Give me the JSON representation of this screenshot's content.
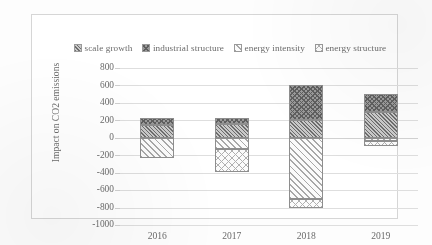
{
  "chart_data": {
    "type": "bar",
    "stacked": true,
    "title": "",
    "xlabel": "",
    "ylabel": "Impact on CO2 emissions",
    "categories": [
      "2016",
      "2017",
      "2018",
      "2019"
    ],
    "ylim": [
      -1000,
      800
    ],
    "ytick_step": 200,
    "yticks": [
      "800",
      "600",
      "400",
      "200",
      "0",
      "-200",
      "-400",
      "-600",
      "-800",
      "-1000"
    ],
    "grid": true,
    "legend_position": "top",
    "series": [
      {
        "name": "scale growth",
        "pattern": "dark-diagonal-hatch",
        "values": [
          150,
          160,
          200,
          300
        ]
      },
      {
        "name": "industrial structure",
        "pattern": "dark-crosshatch",
        "values": [
          80,
          70,
          400,
          200
        ]
      },
      {
        "name": "energy intensity",
        "pattern": "light-diagonal-stripe",
        "values": [
          -230,
          -130,
          -700,
          -40
        ]
      },
      {
        "name": "energy structure",
        "pattern": "light-open-crosshatch",
        "values": [
          0,
          -260,
          -100,
          -60
        ]
      }
    ]
  },
  "legend": {
    "items": [
      {
        "label": "scale growth",
        "pattern": "dark-diagonal-hatch"
      },
      {
        "label": "industrial structure",
        "pattern": "dark-crosshatch"
      },
      {
        "label": "energy intensity",
        "pattern": "light-diagonal-stripe"
      },
      {
        "label": "energy structure",
        "pattern": "light-open-crosshatch"
      }
    ]
  },
  "axis": {
    "y_title": "Impact on CO2 emissions",
    "y_labels": [
      "800",
      "600",
      "400",
      "200",
      "0",
      "-200",
      "-400",
      "-600",
      "-800",
      "-1000"
    ],
    "x_labels": [
      "2016",
      "2017",
      "2018",
      "2019"
    ]
  },
  "colors": {
    "frame_border": "#d6d6d6",
    "gridline": "#dedede",
    "text": "#6b6b6b",
    "bar_outline": "#8e8e8e",
    "background": "#ffffff"
  }
}
